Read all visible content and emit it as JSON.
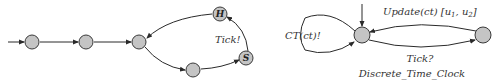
{
  "diagram": {
    "left_automaton": {
      "nodes": [
        {
          "id": "n1",
          "label": ""
        },
        {
          "id": "n2",
          "label": ""
        },
        {
          "id": "n3",
          "label": ""
        },
        {
          "id": "n4",
          "label": ""
        },
        {
          "id": "s",
          "label": "S"
        },
        {
          "id": "h",
          "label": "H"
        }
      ],
      "edges": [
        {
          "from": "init",
          "to": "n1",
          "label": ""
        },
        {
          "from": "n1",
          "to": "n2",
          "label": ""
        },
        {
          "from": "n2",
          "to": "n3",
          "label": ""
        },
        {
          "from": "n3",
          "to": "n4",
          "label": ""
        },
        {
          "from": "n4",
          "to": "s",
          "label": ""
        },
        {
          "from": "s",
          "to": "h",
          "label": "Tick!"
        },
        {
          "from": "h",
          "to": "n3",
          "label": ""
        }
      ],
      "tick_label": "Tick!"
    },
    "right_automaton": {
      "name": "Discrete_Time_Clock",
      "nodes": [
        {
          "id": "c0",
          "label": ""
        },
        {
          "id": "c1",
          "label": ""
        }
      ],
      "edges": [
        {
          "from": "init",
          "to": "c0",
          "label": ""
        },
        {
          "from": "c0",
          "to": "c0",
          "label": "CT(ct)!"
        },
        {
          "from": "c0",
          "to": "c1",
          "label": "Tick?"
        },
        {
          "from": "c1",
          "to": "c0",
          "label": "Update(ct) [u1, u2]"
        }
      ],
      "self_loop_label": "CT(ct)!",
      "update_label": "Update(ct) [u",
      "update_sub1": "1",
      "update_mid": ", u",
      "update_sub2": "2",
      "update_end": "]",
      "tick_label": "Tick?"
    }
  }
}
